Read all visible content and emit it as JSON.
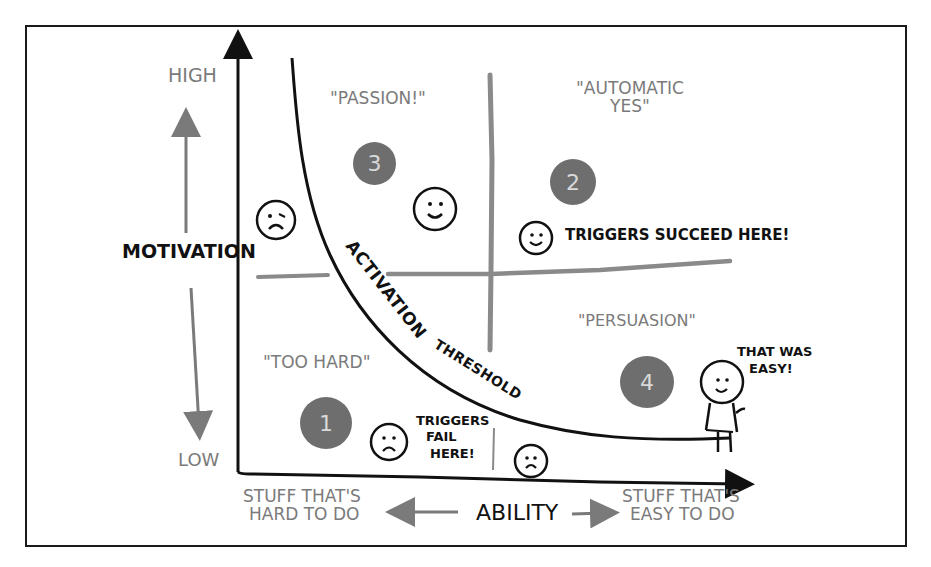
{
  "diagram": {
    "y_axis": {
      "label": "Motivation",
      "high": "High",
      "low": "Low"
    },
    "x_axis": {
      "label": "Ability",
      "left": "Stuff that's hard to do",
      "left_line1": "Stuff that's",
      "left_line2": "hard to do",
      "right": "Stuff that's easy to do",
      "right_line1": "Stuff that's",
      "right_line2": "easy to do"
    },
    "curve_label": {
      "word1": "Activation",
      "word2": "Threshold"
    },
    "quadrants": [
      {
        "number": "1",
        "name": "\"Too hard\""
      },
      {
        "number": "2",
        "name_line1": "\"Automatic",
        "name_line2": "yes\""
      },
      {
        "number": "3",
        "name": "\"Passion!\""
      },
      {
        "number": "4",
        "name": "\"Persuasion\""
      }
    ],
    "annotations": {
      "triggers_succeed": "Triggers succeed here!",
      "triggers_fail_line1": "Triggers",
      "triggers_fail_line2": "fail",
      "triggers_fail_line3": "here!",
      "stick_figure_line1": "That was",
      "stick_figure_line2": "easy!"
    },
    "faces": [
      {
        "mood": "sad",
        "region": "high-motivation-hard"
      },
      {
        "mood": "happy",
        "region": "passion"
      },
      {
        "mood": "happy",
        "region": "triggers-succeed"
      },
      {
        "mood": "sad",
        "region": "triggers-fail-left"
      },
      {
        "mood": "sad",
        "region": "triggers-fail-right"
      },
      {
        "mood": "happy",
        "region": "stick-figure"
      }
    ],
    "colors": {
      "ink": "#111111",
      "gray_ink": "#7a7a7a",
      "badge_fill": "#6e6e6e",
      "badge_text": "#d9d9d9",
      "divider": "#8a8a8a"
    }
  }
}
